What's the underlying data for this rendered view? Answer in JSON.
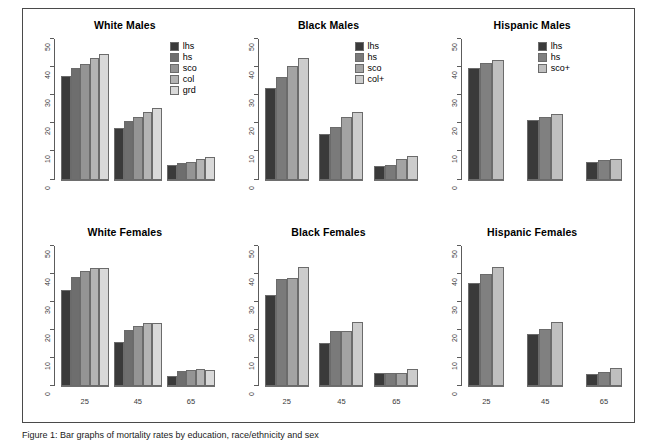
{
  "figure": {
    "caption": "Figure 1: Bar graphs of mortality rates by education, race/ethnicity and sex"
  },
  "chart_data": {
    "type": "bar",
    "title": "",
    "xlabel": "",
    "ylabel": "",
    "ylim": [
      0,
      50
    ],
    "yticks": [
      0,
      10,
      20,
      30,
      40,
      50
    ],
    "categories": [
      "25",
      "45",
      "65"
    ],
    "grid": false,
    "legend_position": "top-right inside panel",
    "panels": [
      {
        "title": "White Males",
        "legend": [
          "lhs",
          "hs",
          "sco",
          "col",
          "grd"
        ],
        "series": [
          {
            "name": "lhs",
            "values": [
              36.8,
              18.5,
              5.2
            ]
          },
          {
            "name": "hs",
            "values": [
              39.7,
              21.0,
              5.7
            ]
          },
          {
            "name": "sco",
            "values": [
              41.0,
              22.2,
              6.4
            ]
          },
          {
            "name": "col",
            "values": [
              43.2,
              24.0,
              7.4
            ]
          },
          {
            "name": "grd",
            "values": [
              44.6,
              25.4,
              8.0
            ]
          }
        ]
      },
      {
        "title": "Black Males",
        "legend": [
          "lhs",
          "hs",
          "sco",
          "col+"
        ],
        "series": [
          {
            "name": "lhs",
            "values": [
              32.6,
              16.2,
              4.8
            ]
          },
          {
            "name": "hs",
            "values": [
              36.6,
              18.6,
              5.0
            ]
          },
          {
            "name": "sco",
            "values": [
              40.3,
              22.1,
              7.3
            ]
          },
          {
            "name": "col+",
            "values": [
              43.2,
              24.0,
              8.5
            ]
          }
        ]
      },
      {
        "title": "Hispanic Males",
        "legend": [
          "lhs",
          "hs",
          "sco+"
        ],
        "series": [
          {
            "name": "lhs",
            "values": [
              39.7,
              21.1,
              6.4
            ]
          },
          {
            "name": "hs",
            "values": [
              41.3,
              22.4,
              6.8
            ]
          },
          {
            "name": "sco+",
            "values": [
              42.7,
              23.4,
              7.4
            ]
          }
        ]
      },
      {
        "title": "White Females",
        "legend": [
          "lhs",
          "hs",
          "sco",
          "col",
          "grd"
        ],
        "series": [
          {
            "name": "lhs",
            "values": [
              34.1,
              15.7,
              3.6
            ]
          },
          {
            "name": "hs",
            "values": [
              38.8,
              19.8,
              5.3
            ]
          },
          {
            "name": "sco",
            "values": [
              40.8,
              21.2,
              5.8
            ]
          },
          {
            "name": "col",
            "values": [
              41.9,
              22.3,
              6.1
            ]
          },
          {
            "name": "grd",
            "values": [
              42.0,
              22.4,
              5.8
            ]
          }
        ]
      },
      {
        "title": "Black Females",
        "legend": [
          "lhs",
          "hs",
          "sco",
          "col+"
        ],
        "series": [
          {
            "name": "lhs",
            "values": [
              32.4,
              15.4,
              4.6
            ]
          },
          {
            "name": "hs",
            "values": [
              38.1,
              19.5,
              4.8
            ]
          },
          {
            "name": "sco",
            "values": [
              38.5,
              19.7,
              4.7
            ]
          },
          {
            "name": "col+",
            "values": [
              42.2,
              22.8,
              6.2
            ]
          }
        ]
      },
      {
        "title": "Hispanic Females",
        "legend": [
          "lhs",
          "hs",
          "sco+"
        ],
        "series": [
          {
            "name": "lhs",
            "values": [
              36.5,
              18.4,
              4.2
            ]
          },
          {
            "name": "hs",
            "values": [
              39.8,
              20.4,
              5.0
            ]
          },
          {
            "name": "sco+",
            "values": [
              42.4,
              22.8,
              6.4
            ]
          }
        ]
      }
    ],
    "colors": {
      "palette_5": [
        "#3a3a3a",
        "#6e6e6e",
        "#949494",
        "#b4b4b4",
        "#d9d9d9"
      ],
      "palette_4": [
        "#3a3a3a",
        "#7a7a7a",
        "#a3a3a3",
        "#cccccc"
      ],
      "palette_3": [
        "#3a3a3a",
        "#808080",
        "#bfbfbf"
      ],
      "bar_border": "#6b6b6b",
      "axis": "#5c5c5c",
      "frame": "#4a4a4a",
      "text": "#000000"
    }
  }
}
